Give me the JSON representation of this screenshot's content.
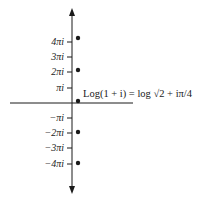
{
  "diagram": {
    "annotation": "Log(1 + i) = log √2 + iπ/4",
    "axis": {
      "vertical_x": 72,
      "horizontal_y": 103,
      "horizontal_from": 10,
      "horizontal_to": 133,
      "vertical_from": 8,
      "vertical_to": 194,
      "arrow_up": "arrow-up",
      "arrow_down": "arrow-down"
    },
    "ticks": [
      {
        "label": "4πi",
        "y": 42
      },
      {
        "label": "3πi",
        "y": 57
      },
      {
        "label": "2πi",
        "y": 72
      },
      {
        "label": "πi",
        "y": 88
      },
      {
        "label": "−πi",
        "y": 118
      },
      {
        "label": "−2πi",
        "y": 133
      },
      {
        "label": "−3πi",
        "y": 148
      },
      {
        "label": "−4πi",
        "y": 164
      }
    ],
    "points": [
      {
        "label": "log √2 + iπ/4 + 4πi",
        "x": 78,
        "y": 38
      },
      {
        "label": "log √2 + iπ/4 + 2πi",
        "x": 78,
        "y": 70
      },
      {
        "label": "log √2 + iπ/4",
        "x": 78,
        "y": 101
      },
      {
        "label": "log √2 + iπ/4 − 2πi",
        "x": 78,
        "y": 132
      },
      {
        "label": "log √2 + iπ/4 − 4πi",
        "x": 78,
        "y": 163
      }
    ]
  }
}
